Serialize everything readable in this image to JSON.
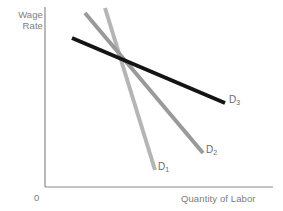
{
  "figure": {
    "width": 283,
    "height": 211,
    "background": "#ffffff"
  },
  "axes": {
    "origin_label": "0",
    "y_axis_title_line1": "Wage",
    "y_axis_title_line2": "Rate",
    "x_axis_title": "Quantity of Labor",
    "axis_color": "#8a8a8a"
  },
  "curve_labels": {
    "d1": "D",
    "d1_sub": "1",
    "d2": "D",
    "d2_sub": "2",
    "d3": "D",
    "d3_sub": "3"
  },
  "chart_data": {
    "type": "line",
    "title": "",
    "xlabel": "Quantity of Labor",
    "ylabel": "Wage Rate",
    "grid": false,
    "legend": "inline-end-labels",
    "axis_ticks": false,
    "origin": "0",
    "series": [
      {
        "name": "D1",
        "label": "D₁",
        "color": "#b5b5b5",
        "linewidth": 4,
        "elasticity": "least elastic (steepest)",
        "x": [
          105,
          155
        ],
        "y": [
          8,
          170
        ],
        "label_position": {
          "x": 158,
          "y": 168
        }
      },
      {
        "name": "D2",
        "label": "D₂",
        "color": "#9a9a9a",
        "linewidth": 4,
        "elasticity": "intermediate",
        "x": [
          85,
          203
        ],
        "y": [
          13,
          153
        ],
        "label_position": {
          "x": 206,
          "y": 151
        }
      },
      {
        "name": "D3",
        "label": "D₃",
        "color": "#141414",
        "linewidth": 4,
        "elasticity": "most elastic (flattest)",
        "x": [
          72,
          225
        ],
        "y": [
          38,
          103
        ],
        "label_position": {
          "x": 229,
          "y": 101
        }
      }
    ],
    "intersection_point": {
      "x": 120,
      "y": 58
    },
    "axis_extent": {
      "y_axis": {
        "x": 45,
        "y_top": 7,
        "y_bottom": 187
      },
      "x_axis": {
        "y": 187,
        "x_left": 45,
        "x_right": 273
      }
    }
  }
}
